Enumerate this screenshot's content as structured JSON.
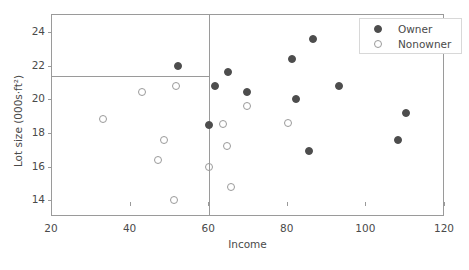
{
  "chart_data": {
    "type": "scatter",
    "title": "",
    "xlabel": "Income",
    "ylabel": "Lot size (000s·ft²)",
    "xlim": [
      20,
      120
    ],
    "ylim": [
      13,
      25
    ],
    "xticks": [
      20,
      40,
      60,
      80,
      100,
      120
    ],
    "yticks": [
      14,
      16,
      18,
      20,
      22,
      24
    ],
    "grid": false,
    "legend_position": "top-right",
    "legend": [
      "Owner",
      "Nonowner"
    ],
    "annotations": [
      {
        "kind": "vline",
        "x": 60.0,
        "label": "income split at 60"
      },
      {
        "kind": "hline",
        "y": 21.4,
        "x_from": 20.0,
        "x_to": 60.0,
        "label": "lot size split at 21.4"
      }
    ],
    "series": [
      {
        "name": "Owner",
        "marker": "filled-circle",
        "color": "#4d4d4d",
        "points": [
          {
            "x": 52.0,
            "y": 22.0
          },
          {
            "x": 59.9,
            "y": 18.45
          },
          {
            "x": 61.5,
            "y": 20.8
          },
          {
            "x": 64.8,
            "y": 21.6
          },
          {
            "x": 69.5,
            "y": 20.4
          },
          {
            "x": 81.0,
            "y": 22.4
          },
          {
            "x": 82.0,
            "y": 20.0
          },
          {
            "x": 85.5,
            "y": 16.9
          },
          {
            "x": 86.5,
            "y": 23.6
          },
          {
            "x": 93.0,
            "y": 20.8
          },
          {
            "x": 108.0,
            "y": 17.6
          },
          {
            "x": 110.0,
            "y": 19.2
          }
        ]
      },
      {
        "name": "Nonowner",
        "marker": "open-circle",
        "color": "#9a9a9a",
        "points": [
          {
            "x": 33.0,
            "y": 18.8
          },
          {
            "x": 43.0,
            "y": 20.4
          },
          {
            "x": 47.0,
            "y": 16.4
          },
          {
            "x": 48.5,
            "y": 17.6
          },
          {
            "x": 51.0,
            "y": 14.0
          },
          {
            "x": 51.5,
            "y": 20.8
          },
          {
            "x": 60.0,
            "y": 16.0
          },
          {
            "x": 63.5,
            "y": 18.5
          },
          {
            "x": 64.5,
            "y": 17.2
          },
          {
            "x": 65.5,
            "y": 14.8
          },
          {
            "x": 69.5,
            "y": 19.6
          },
          {
            "x": 80.0,
            "y": 18.6
          }
        ]
      }
    ]
  }
}
